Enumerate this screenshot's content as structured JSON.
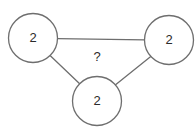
{
  "diagram": {
    "type": "triangle-node-graph",
    "background_color": "#ffffff",
    "stroke_color": "#6e6e6e",
    "text_color": "#2b2b2b",
    "nodes": [
      {
        "id": "left",
        "label": "2",
        "cx": 33,
        "cy": 38,
        "r": 24.5
      },
      {
        "id": "right",
        "label": "2",
        "cx": 169,
        "cy": 40,
        "r": 24.5
      },
      {
        "id": "bottom",
        "label": "2",
        "cx": 97,
        "cy": 101,
        "r": 24.5
      }
    ],
    "edges": [
      {
        "id": "top-edge",
        "from": "left",
        "to": "right",
        "x1": 57.5,
        "y1": 38.6,
        "x2": 144.5,
        "y2": 39.8
      },
      {
        "id": "left-edge",
        "from": "left",
        "to": "bottom",
        "x1": 48.5,
        "y1": 54.0,
        "x2": 81.5,
        "y2": 85.5
      },
      {
        "id": "right-edge",
        "from": "right",
        "to": "bottom",
        "x1": 152.0,
        "y1": 55.5,
        "x2": 114.0,
        "y2": 86.0
      }
    ],
    "center_marker": {
      "id": "unknown-value",
      "label": "?",
      "x": 97,
      "y": 58
    }
  }
}
